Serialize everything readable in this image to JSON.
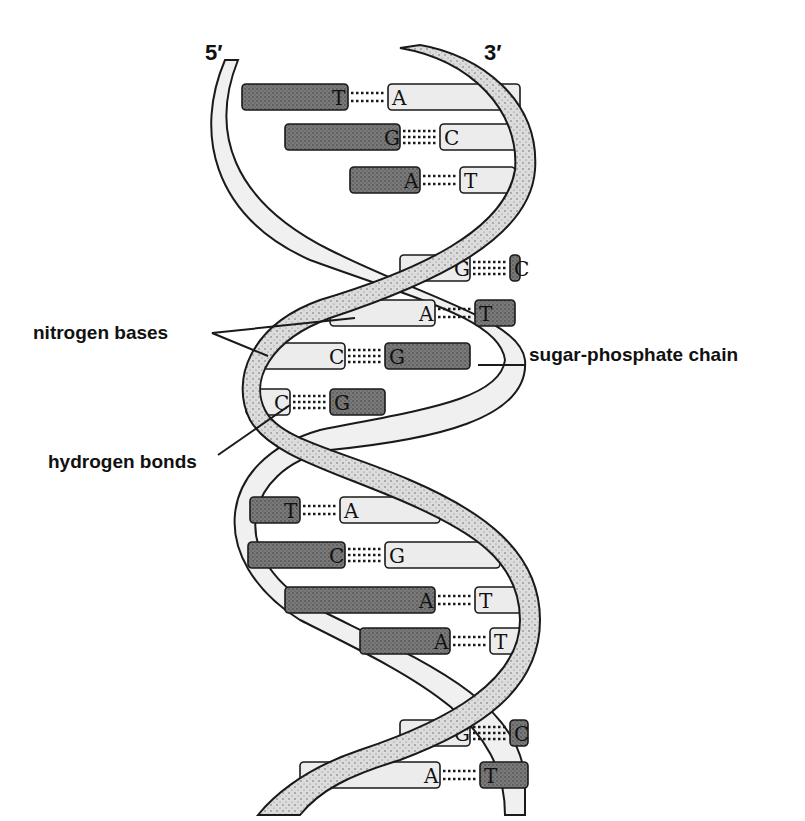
{
  "diagram": {
    "ends": {
      "left": "5′",
      "right": "3′"
    },
    "labels": {
      "nitrogen_bases": "nitrogen bases",
      "hydrogen_bonds": "hydrogen bonds",
      "sugar_phosphate_chain": "sugar-phosphate chain"
    },
    "colors": {
      "dark_base": "#6e6e6e",
      "light_base": "#ececec",
      "strand_stippled": "#d6d6d6",
      "strand_light": "#f0f0f0",
      "outline": "#1a1a1a"
    },
    "base_pairs": [
      {
        "left": "T",
        "right": "A",
        "y": 97,
        "left_dark": true,
        "x_left": 242,
        "x_mid": 368,
        "x_right": 520
      },
      {
        "left": "G",
        "right": "C",
        "y": 137,
        "left_dark": true,
        "x_left": 285,
        "x_mid": 420,
        "x_right": 525
      },
      {
        "left": "A",
        "right": "T",
        "y": 180,
        "left_dark": true,
        "x_left": 350,
        "x_mid": 440,
        "x_right": 515
      },
      {
        "left": "G",
        "right": "C",
        "y": 268,
        "left_dark": false,
        "x_left": 400,
        "x_mid": 490,
        "x_right": 520
      },
      {
        "left": "A",
        "right": "T",
        "y": 313,
        "left_dark": false,
        "x_left": 330,
        "x_mid": 455,
        "x_right": 515
      },
      {
        "left": "C",
        "right": "G",
        "y": 356,
        "left_dark": false,
        "x_left": 262,
        "x_mid": 365,
        "x_right": 470
      },
      {
        "left": "C",
        "right": "G",
        "y": 402,
        "left_dark": false,
        "x_left": 246,
        "x_mid": 310,
        "x_right": 385
      },
      {
        "left": "T",
        "right": "A",
        "y": 510,
        "left_dark": true,
        "x_left": 250,
        "x_mid": 320,
        "x_right": 440
      },
      {
        "left": "C",
        "right": "G",
        "y": 555,
        "left_dark": true,
        "x_left": 248,
        "x_mid": 365,
        "x_right": 500
      },
      {
        "left": "A",
        "right": "T",
        "y": 600,
        "left_dark": true,
        "x_left": 285,
        "x_mid": 455,
        "x_right": 525
      },
      {
        "left": "A",
        "right": "T",
        "y": 641,
        "left_dark": true,
        "x_left": 360,
        "x_mid": 470,
        "x_right": 525
      },
      {
        "left": "G",
        "right": "C",
        "y": 733,
        "left_dark": false,
        "x_left": 400,
        "x_mid": 490,
        "x_right": 528
      },
      {
        "left": "A",
        "right": "T",
        "y": 775,
        "left_dark": false,
        "x_left": 300,
        "x_mid": 460,
        "x_right": 528
      }
    ]
  }
}
